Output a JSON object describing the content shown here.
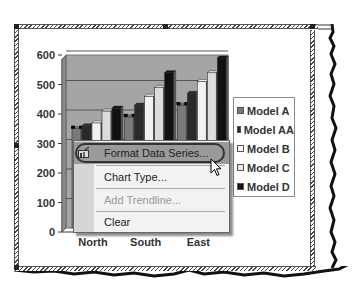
{
  "chart_data": {
    "type": "bar",
    "style": "3d-clustered-column",
    "title": "",
    "xlabel": "",
    "ylabel": "",
    "categories": [
      "North",
      "South",
      "East"
    ],
    "series": [
      {
        "name": "Model A",
        "values": [
          340,
          380,
          420
        ],
        "color": "#7a7a7a"
      },
      {
        "name": "Model AA",
        "values": [
          350,
          420,
          460
        ],
        "color": "#2a2a2a"
      },
      {
        "name": "Model B",
        "values": [
          360,
          450,
          500
        ],
        "color": "#f2f2f2"
      },
      {
        "name": "Model C",
        "values": [
          400,
          480,
          530
        ],
        "color": "#dcdcdc"
      },
      {
        "name": "Model D",
        "values": [
          410,
          530,
          580
        ],
        "color": "#111111"
      }
    ],
    "ylim": [
      0,
      600
    ],
    "yticks": [
      "0",
      "100",
      "200",
      "300",
      "400",
      "500",
      "600"
    ],
    "grid": true,
    "legend": "right",
    "plot_background": "#a5a5a5"
  },
  "legend": {
    "items": [
      {
        "label": "Model A",
        "color": "#7a7a7a"
      },
      {
        "label": "Model AA",
        "color": "#2a2a2a"
      },
      {
        "label": "Model B",
        "color": "#f8f8f8"
      },
      {
        "label": "Model C",
        "color": "#e6e6e6"
      },
      {
        "label": "Model D",
        "color": "#111111"
      }
    ]
  },
  "context_menu": {
    "items": [
      {
        "label": "Format Data Series...",
        "state": "highlighted",
        "icon": "format-data-series-icon"
      },
      {
        "label": "Chart Type...",
        "state": "enabled"
      },
      {
        "label": "Add Trendline...",
        "state": "disabled"
      },
      {
        "label": "Clear",
        "state": "enabled"
      }
    ]
  },
  "cursor": {
    "icon": "mouse-pointer-icon"
  }
}
